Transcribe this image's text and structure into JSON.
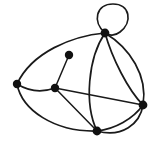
{
  "figure": {
    "name": "undirected-multigraph-drawing",
    "width": 155,
    "height": 145,
    "background_color": "#ffffff",
    "stroke_color": "#1a1a1a",
    "vertex_color": "#111111",
    "vertex_radius": 4.2,
    "edge_width": 1.7,
    "vertex_count": 6,
    "edge_count": 12
  },
  "chart_data": {
    "type": "diagram",
    "title": "",
    "graph_kind": "undirected multigraph with self-loop",
    "vertices": [
      {
        "id": "v-top",
        "label": "",
        "x": 105,
        "y": 33,
        "degree": 7
      },
      {
        "id": "v-pendant",
        "label": "",
        "x": 69,
        "y": 55,
        "degree": 1
      },
      {
        "id": "v-left",
        "label": "",
        "x": 17,
        "y": 84,
        "degree": 3
      },
      {
        "id": "v-center",
        "label": "",
        "x": 55,
        "y": 88,
        "degree": 4
      },
      {
        "id": "v-right",
        "label": "",
        "x": 143,
        "y": 105,
        "degree": 5
      },
      {
        "id": "v-bottom",
        "label": "",
        "x": 97,
        "y": 131,
        "degree": 5
      }
    ],
    "edges": [
      {
        "id": "e-loop-top",
        "from": "v-top",
        "to": "v-top",
        "style": "self-loop",
        "path": "M 105 33 C 92 22 96 4 113 4 C 130 4 133 22 120 32 C 115 36 109 36 105 33 Z"
      },
      {
        "id": "e-top-left",
        "from": "v-top",
        "to": "v-left",
        "style": "curve-outer-upper",
        "path": "M 105 33 C 72 36 32 52 17 84"
      },
      {
        "id": "e-top-right-a",
        "from": "v-top",
        "to": "v-right",
        "style": "curve-bulge-right",
        "path": "M 105 33 C 130 48 148 76 143 105"
      },
      {
        "id": "e-top-right-b",
        "from": "v-top",
        "to": "v-right",
        "style": "curve-bulge-left",
        "path": "M 105 33 C 112 58 128 90 143 105"
      },
      {
        "id": "e-top-bottom",
        "from": "v-top",
        "to": "v-bottom",
        "style": "curve-bulge-left",
        "path": "M 105 33 C 88 58 84 104 97 131"
      },
      {
        "id": "e-left-center",
        "from": "v-left",
        "to": "v-center",
        "style": "slight-curve",
        "path": "M 17 84 C 30 92 44 92 55 88"
      },
      {
        "id": "e-left-bottom",
        "from": "v-left",
        "to": "v-bottom",
        "style": "curve-outer-lower",
        "path": "M 17 84 C 22 110 54 132 97 131"
      },
      {
        "id": "e-center-pendant",
        "from": "v-center",
        "to": "v-pendant",
        "style": "straight",
        "path": "M 55 88 L 69 55"
      },
      {
        "id": "e-center-right",
        "from": "v-center",
        "to": "v-right",
        "style": "straight",
        "path": "M 55 88 L 143 105"
      },
      {
        "id": "e-center-bottom",
        "from": "v-center",
        "to": "v-bottom",
        "style": "straight",
        "path": "M 55 88 L 97 131"
      },
      {
        "id": "e-bottom-right",
        "from": "v-bottom",
        "to": "v-right",
        "style": "slight-curve",
        "path": "M 97 131 C 115 129 133 119 143 105"
      },
      {
        "id": "e-right-bottom-outer",
        "from": "v-right",
        "to": "v-bottom",
        "style": "curve-outer-lower",
        "path": "M 143 105 C 140 124 122 138 97 131"
      }
    ]
  }
}
